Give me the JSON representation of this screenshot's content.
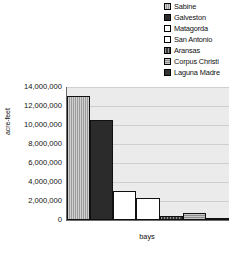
{
  "chart_data": {
    "type": "bar",
    "title": "",
    "xlabel": "bays",
    "ylabel": "acre-feet",
    "categories": [
      "Sabine",
      "Galveston",
      "Matagorda",
      "San Antonio",
      "Aransas",
      "Corpus Christi",
      "Laguna Madre"
    ],
    "values": [
      13100000,
      10500000,
      3100000,
      2350000,
      450000,
      700000,
      180000
    ],
    "ylim": [
      0,
      14000000
    ],
    "ytick_labels": [
      "14,000,000",
      "12,000,000",
      "10,000,000",
      "8,000,000",
      "6,000,000",
      "4,000,000",
      "2,000,000",
      "0"
    ],
    "ytick_values": [
      14000000,
      12000000,
      10000000,
      8000000,
      6000000,
      4000000,
      2000000,
      0
    ],
    "grid": true,
    "legend_position": "top-right",
    "legend": [
      {
        "label": "Sabine",
        "swatch": "fill-sabine",
        "color": "#9a9a9a"
      },
      {
        "label": "Galveston",
        "swatch": "fill-galveston",
        "color": "#2b2b2b"
      },
      {
        "label": "Matagorda",
        "swatch": "fill-matagorda",
        "color": "#ffffff"
      },
      {
        "label": "San Antonio",
        "swatch": "fill-sanantonio",
        "color": "#ffffff"
      },
      {
        "label": "Aransas",
        "swatch": "fill-aransas",
        "color": "#3a3a3a"
      },
      {
        "label": "Corpus Christi",
        "swatch": "fill-corpus",
        "color": "#8e8e8e"
      },
      {
        "label": "Laguna Madre",
        "swatch": "fill-laguna",
        "color": "#333333"
      }
    ],
    "plot_background": "#ebebeb",
    "gridline_color": "#cfcfcf",
    "axis_color": "#6b6b6b"
  }
}
